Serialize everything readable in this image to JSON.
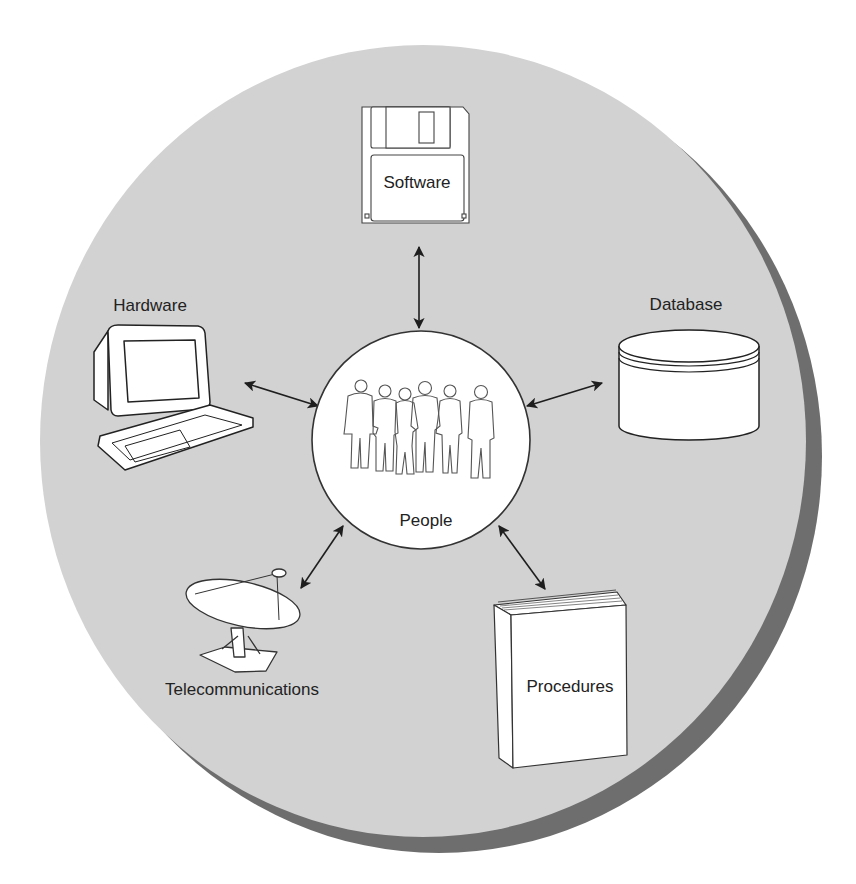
{
  "diagram": {
    "colors": {
      "background": "#ffffff",
      "disc": "#d2d2d2",
      "disc_shadow": "#6e6e6e",
      "line": "#1e1e1e",
      "icon_fill": "#ffffff"
    },
    "center": {
      "label": "People",
      "icon": "people-icon"
    },
    "components": [
      {
        "id": "software",
        "label": "Software",
        "icon": "floppy-disk-icon"
      },
      {
        "id": "hardware",
        "label": "Hardware",
        "icon": "computer-icon"
      },
      {
        "id": "database",
        "label": "Database",
        "icon": "database-cylinder-icon"
      },
      {
        "id": "telecommunications",
        "label": "Telecommunications",
        "icon": "satellite-dish-icon"
      },
      {
        "id": "procedures",
        "label": "Procedures",
        "icon": "book-icon"
      }
    ],
    "connections": [
      {
        "from": "People",
        "to": "Software",
        "type": "bidirectional-arrow"
      },
      {
        "from": "People",
        "to": "Hardware",
        "type": "bidirectional-arrow"
      },
      {
        "from": "People",
        "to": "Database",
        "type": "bidirectional-arrow"
      },
      {
        "from": "People",
        "to": "Telecommunications",
        "type": "bidirectional-arrow"
      },
      {
        "from": "People",
        "to": "Procedures",
        "type": "bidirectional-arrow"
      }
    ]
  }
}
